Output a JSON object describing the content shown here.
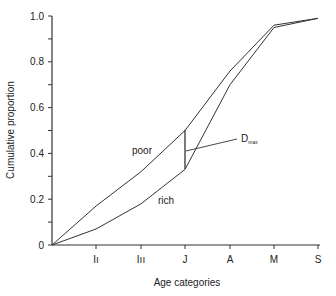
{
  "chart_data": {
    "type": "line",
    "title": "",
    "xlabel": "Age categories",
    "ylabel": "Cumulative proportion",
    "categories": [
      "0",
      "I I",
      "I II",
      "J",
      "A",
      "M",
      "S"
    ],
    "x_tick_labels": [
      "I",
      "II",
      "J",
      "A",
      "M",
      "S"
    ],
    "y_tick_labels": [
      "0",
      "0.2",
      "0.4",
      "0.6",
      "0.8",
      "1.0"
    ],
    "ylim": [
      0,
      1.0
    ],
    "grid": false,
    "series": [
      {
        "name": "poor",
        "values": [
          0,
          0.17,
          0.32,
          0.5,
          0.76,
          0.96,
          0.99
        ]
      },
      {
        "name": "rich",
        "values": [
          0,
          0.07,
          0.18,
          0.33,
          0.7,
          0.95,
          0.99
        ]
      }
    ],
    "annotations": [
      {
        "text": "D",
        "subscript": "max",
        "note": "maximum difference at J (between 0.33 and 0.50)"
      }
    ]
  },
  "labels": {
    "poor": "poor",
    "rich": "rich",
    "dmax": "D",
    "dmax_sub": "max",
    "xlabel": "Age categories",
    "ylabel": "Cumulative proportion"
  }
}
